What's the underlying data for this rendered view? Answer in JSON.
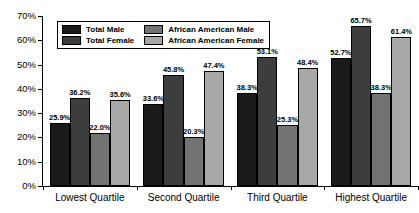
{
  "chart_data": {
    "type": "bar",
    "title": "",
    "subtitle": "",
    "xlabel": "",
    "ylabel": "",
    "ylim": [
      0,
      70
    ],
    "grid": false,
    "legend_position": "top-left inside plot",
    "y_ticks": [
      "0%",
      "10%",
      "20%",
      "30%",
      "40%",
      "50%",
      "60%",
      "70%"
    ],
    "y_tick_values": [
      0,
      10,
      20,
      30,
      40,
      50,
      60,
      70
    ],
    "categories": [
      "Lowest Quartile",
      "Second Quartile",
      "Third Quartile",
      "Highest Quartile"
    ],
    "series": [
      {
        "name": "Total Male",
        "color": "#1a1a1a",
        "values": [
          25.9,
          33.6,
          38.3,
          52.7
        ],
        "labels": [
          "25.9%",
          "33.6%",
          "38.3%",
          "52.7%"
        ]
      },
      {
        "name": "Total Female",
        "color": "#3d3d3d",
        "values": [
          36.2,
          45.8,
          53.1,
          65.7
        ],
        "labels": [
          "36.2%",
          "45.8%",
          "53.1%",
          "65.7%"
        ]
      },
      {
        "name": "African American Male",
        "color": "#737373",
        "values": [
          22.0,
          20.3,
          25.3,
          38.3
        ],
        "labels": [
          "22.0%",
          "20.3%",
          "25.3%",
          "38.3%"
        ]
      },
      {
        "name": "African American Female",
        "color": "#a8a8a8",
        "values": [
          35.6,
          47.4,
          48.4,
          61.4
        ],
        "labels": [
          "35.6%",
          "47.4%",
          "48.4%",
          "61.4%"
        ]
      }
    ]
  },
  "legend": {
    "entries": [
      {
        "label": "Total Male",
        "color": "#1a1a1a"
      },
      {
        "label": "African American Male",
        "color": "#737373"
      },
      {
        "label": "Total Female",
        "color": "#3d3d3d"
      },
      {
        "label": "African American Female",
        "color": "#a8a8a8"
      }
    ]
  },
  "axis": {
    "y_labels": [
      "70%",
      "60%",
      "50%",
      "40%",
      "30%",
      "20%",
      "10%",
      "0%"
    ],
    "x_labels": [
      "Lowest Quartile",
      "Second Quartile",
      "Third Quartile",
      "Highest Quartile"
    ]
  }
}
